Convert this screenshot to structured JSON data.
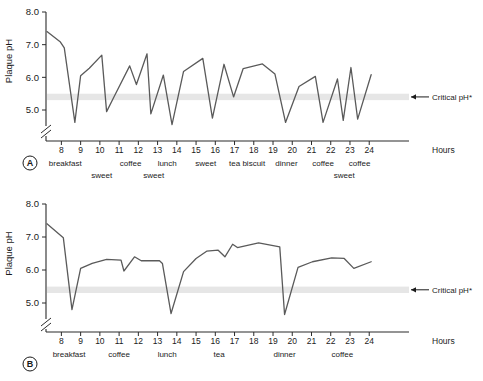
{
  "figure": {
    "y_axis_title": "Plaque pH",
    "x_axis_title": "Hours",
    "critical_label": "Critical pH*",
    "y_ticks": [
      "5.0",
      "6.0",
      "7.0",
      "8.0"
    ],
    "x_ticks": [
      "8",
      "9",
      "10",
      "11",
      "12",
      "13",
      "14",
      "15",
      "16",
      "17",
      "18",
      "19",
      "20",
      "21",
      "22",
      "23",
      "24"
    ],
    "critical_ph_value": 5.4,
    "band_color": "#e6e6e6",
    "curve_color": "#5a5a5a",
    "axis_color": "#2b2b2b"
  },
  "panels": [
    {
      "id": "A",
      "label": "A",
      "events_row1": [
        {
          "label": "breakfast",
          "hour": 8.2
        },
        {
          "label": "coffee",
          "hour": 11.6
        },
        {
          "label": "lunch",
          "hour": 13.5
        },
        {
          "label": "sweet",
          "hour": 15.5
        },
        {
          "label": "tea",
          "hour": 17.0
        },
        {
          "label": "biscuit",
          "hour": 18.0
        },
        {
          "label": "dinner",
          "hour": 19.7
        },
        {
          "label": "coffee",
          "hour": 21.6
        },
        {
          "label": "coffee",
          "hour": 23.5
        }
      ],
      "events_row2": [
        {
          "label": "sweet",
          "hour": 10.1
        },
        {
          "label": "sweet",
          "hour": 12.8
        },
        {
          "label": "sweet",
          "hour": 22.7
        }
      ]
    },
    {
      "id": "B",
      "label": "B",
      "events_row1": [
        {
          "label": "breakfast",
          "hour": 8.4
        },
        {
          "label": "coffee",
          "hour": 11.0
        },
        {
          "label": "lunch",
          "hour": 13.5
        },
        {
          "label": "tea",
          "hour": 16.2
        },
        {
          "label": "dinner",
          "hour": 19.6
        },
        {
          "label": "coffee",
          "hour": 22.6
        }
      ],
      "events_row2": []
    }
  ],
  "chart_data": [
    {
      "type": "line",
      "id": "A",
      "title": "",
      "xlabel": "Hours",
      "ylabel": "Plaque pH",
      "xlim": [
        7.2,
        25.6
      ],
      "ylim": [
        4.3,
        8.0
      ],
      "grid": false,
      "legend": false,
      "annotations": [
        {
          "text": "Critical pH*",
          "y": 5.4,
          "type": "hline-band"
        },
        {
          "text": "A",
          "type": "panel-label"
        }
      ],
      "description": "Stephan curve with frequent sugar exposures; pH repeatedly falls below the critical pH of 5.4",
      "series": [
        {
          "name": "Plaque pH (frequent intake)",
          "x": [
            7.25,
            7.95,
            8.15,
            8.7,
            9.0,
            9.45,
            10.1,
            10.35,
            10.75,
            11.55,
            11.9,
            12.45,
            12.65,
            13.3,
            13.75,
            14.35,
            15.35,
            15.85,
            16.45,
            16.95,
            17.45,
            18.45,
            19.1,
            19.65,
            20.35,
            21.2,
            21.6,
            22.35,
            22.65,
            23.05,
            23.4,
            24.1
          ],
          "y": [
            7.4,
            7.08,
            6.9,
            4.62,
            6.05,
            6.28,
            6.68,
            4.95,
            5.42,
            6.35,
            5.78,
            6.72,
            4.88,
            6.07,
            4.55,
            6.18,
            6.58,
            4.75,
            6.4,
            5.4,
            6.27,
            6.41,
            6.1,
            4.62,
            5.72,
            6.03,
            4.62,
            5.95,
            4.68,
            6.3,
            4.72,
            6.08
          ]
        }
      ]
    },
    {
      "type": "line",
      "id": "B",
      "title": "",
      "xlabel": "Hours",
      "ylabel": "Plaque pH",
      "xlim": [
        7.2,
        25.6
      ],
      "ylim": [
        4.3,
        8.0
      ],
      "grid": false,
      "legend": false,
      "annotations": [
        {
          "text": "Critical pH*",
          "y": 5.4,
          "type": "hline-band"
        },
        {
          "text": "B",
          "type": "panel-label"
        }
      ],
      "description": "Stephan curve with only three main meals; pH drops below critical pH only three times",
      "series": [
        {
          "name": "Plaque pH (three meals)",
          "x": [
            7.25,
            8.1,
            8.55,
            9.0,
            9.6,
            10.35,
            11.1,
            11.25,
            11.8,
            12.15,
            13.1,
            13.25,
            13.7,
            14.35,
            15.0,
            15.55,
            16.15,
            16.5,
            16.9,
            17.15,
            18.25,
            19.35,
            19.6,
            20.3,
            21.05,
            22.05,
            22.7,
            23.2,
            24.1
          ],
          "y": [
            7.4,
            6.98,
            4.8,
            6.05,
            6.2,
            6.32,
            6.3,
            5.97,
            6.4,
            6.28,
            6.28,
            6.2,
            4.68,
            5.95,
            6.35,
            6.57,
            6.6,
            6.4,
            6.78,
            6.68,
            6.82,
            6.7,
            4.65,
            6.08,
            6.25,
            6.37,
            6.35,
            6.05,
            6.25
          ]
        }
      ]
    }
  ]
}
